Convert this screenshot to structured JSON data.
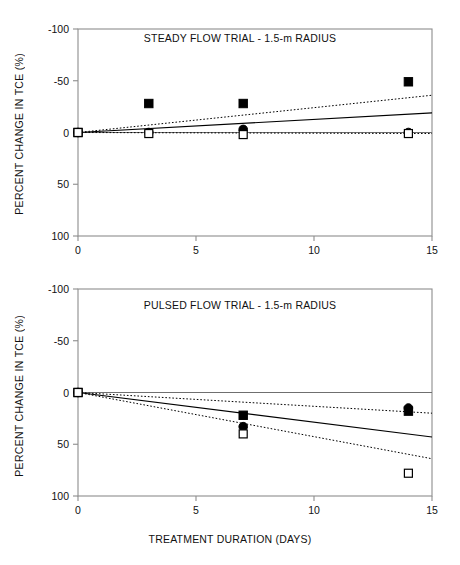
{
  "figure": {
    "xaxis_title": "TREATMENT DURATION  (DAYS)",
    "yaxis_title": "PERCENT CHANGE IN TCE (%)"
  },
  "panels": {
    "top": {
      "title": "STEADY FLOW TRIAL - 1.5-m RADIUS",
      "xticklabels": [
        "0",
        "5",
        "10",
        "15"
      ],
      "yticklabels": [
        "100",
        "50",
        "0",
        "-50",
        "-100"
      ]
    },
    "bottom": {
      "title": "PULSED FLOW TRIAL - 1.5-m RADIUS",
      "xticklabels": [
        "0",
        "5",
        "10",
        "15"
      ],
      "yticklabels": [
        "100",
        "50",
        "0",
        "-50",
        "-100"
      ]
    }
  },
  "chart_data": [
    {
      "type": "scatter",
      "panel": "top",
      "title": "STEADY FLOW TRIAL - 1.5-m RADIUS",
      "xlabel": "TREATMENT DURATION  (DAYS)",
      "ylabel": "PERCENT CHANGE IN TCE (%)",
      "xlim": [
        0,
        15
      ],
      "ylim": [
        -100,
        100
      ],
      "xticks": [
        0,
        5,
        10,
        15
      ],
      "yticks": [
        -100,
        -50,
        0,
        50,
        100
      ],
      "grid": false,
      "legend": "none",
      "zero_line": true,
      "series": [
        {
          "name": "filled-square",
          "marker": "filled-square",
          "color": "#000000",
          "x": [
            0,
            3,
            7,
            14
          ],
          "y": [
            0,
            28,
            28,
            49
          ]
        },
        {
          "name": "filled-circle",
          "marker": "filled-circle",
          "color": "#000000",
          "x": [
            0,
            3,
            7,
            14
          ],
          "y": [
            0,
            0,
            3,
            0
          ]
        },
        {
          "name": "open-square",
          "marker": "open-square",
          "color": "#000000",
          "x": [
            0,
            3,
            7,
            14
          ],
          "y": [
            0,
            -1,
            -2,
            -1
          ]
        }
      ],
      "trendlines": [
        {
          "name": "filled-square-fit",
          "style": "dotted",
          "x": [
            0,
            15
          ],
          "y": [
            0,
            36
          ]
        },
        {
          "name": "filled-circle-fit",
          "style": "solid",
          "x": [
            0,
            15
          ],
          "y": [
            0,
            19
          ]
        },
        {
          "name": "open-square-fit",
          "style": "dotted",
          "x": [
            0,
            15
          ],
          "y": [
            0,
            -1
          ]
        }
      ]
    },
    {
      "type": "scatter",
      "panel": "bottom",
      "title": "PULSED FLOW TRIAL - 1.5-m RADIUS",
      "xlabel": "TREATMENT DURATION  (DAYS)",
      "ylabel": "PERCENT CHANGE IN TCE (%)",
      "xlim": [
        0,
        15
      ],
      "ylim": [
        -100,
        100
      ],
      "xticks": [
        0,
        5,
        10,
        15
      ],
      "yticks": [
        -100,
        -50,
        0,
        50,
        100
      ],
      "grid": false,
      "legend": "none",
      "zero_line": true,
      "series": [
        {
          "name": "filled-square",
          "marker": "filled-square",
          "color": "#000000",
          "x": [
            0,
            7,
            14
          ],
          "y": [
            0,
            -22,
            -18
          ]
        },
        {
          "name": "filled-circle",
          "marker": "filled-circle",
          "color": "#000000",
          "x": [
            0,
            7,
            14
          ],
          "y": [
            0,
            -33,
            -15
          ]
        },
        {
          "name": "open-square",
          "marker": "open-square",
          "color": "#000000",
          "x": [
            0,
            7,
            14
          ],
          "y": [
            0,
            -40,
            -78
          ]
        }
      ],
      "trendlines": [
        {
          "name": "filled-square-fit",
          "style": "dotted",
          "x": [
            0,
            15
          ],
          "y": [
            0,
            -20
          ]
        },
        {
          "name": "filled-circle-fit",
          "style": "solid",
          "x": [
            0,
            15
          ],
          "y": [
            0,
            -43
          ]
        },
        {
          "name": "open-square-fit",
          "style": "dotted",
          "x": [
            0,
            15
          ],
          "y": [
            0,
            -64
          ]
        }
      ]
    }
  ]
}
